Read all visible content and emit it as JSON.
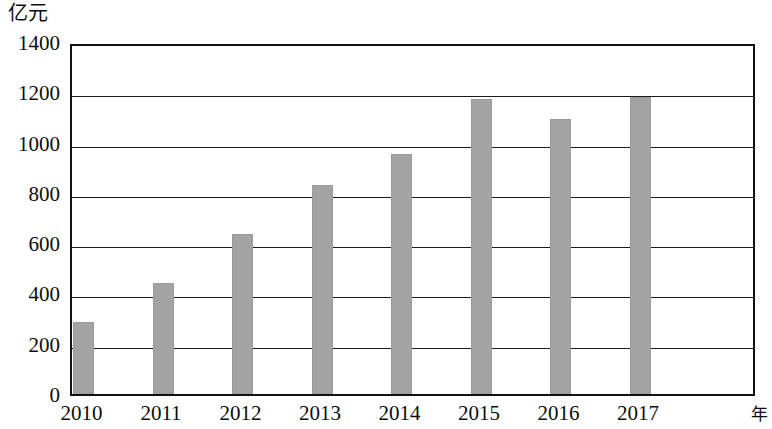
{
  "chart_data": {
    "type": "bar",
    "title": "",
    "subtitle": "",
    "xlabel": "年",
    "ylabel": "亿元",
    "categories": [
      "2010",
      "2011",
      "2012",
      "2013",
      "2014",
      "2015",
      "2016",
      "2017"
    ],
    "values": [
      294,
      449,
      644,
      839,
      962,
      1181,
      1101,
      1189
    ],
    "ylim": [
      0,
      1400
    ],
    "y_ticks": [
      0,
      200,
      400,
      600,
      800,
      1000,
      1200,
      1400
    ],
    "y_tick_labels": [
      "0",
      "200",
      "400",
      "600",
      "800",
      "1000",
      "1200",
      "1400"
    ],
    "grid": true,
    "grid_axis": "y",
    "legend": false,
    "legend_position": "none",
    "bar_color": "#a3a3a3",
    "axis_color": "#111111",
    "background_color": "#ffffff",
    "series": [
      {
        "name": "",
        "values": [
          294,
          449,
          644,
          839,
          962,
          1181,
          1101,
          1189
        ]
      }
    ]
  },
  "axes": {
    "y_unit_caption": "亿元",
    "x_unit_caption": "年"
  }
}
